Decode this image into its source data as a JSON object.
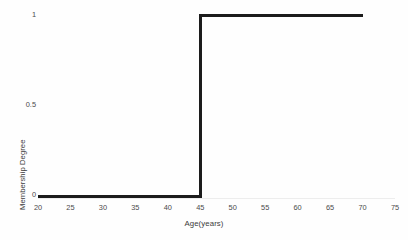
{
  "chart_data": {
    "type": "line",
    "title": "",
    "subtitle": "",
    "xlabel": "Age(years)",
    "ylabel": "Membership Degree",
    "xlim": [
      20,
      75
    ],
    "ylim": [
      0,
      1
    ],
    "grid": false,
    "legend": false,
    "x_ticks": [
      20,
      25,
      30,
      35,
      40,
      45,
      50,
      55,
      60,
      65,
      70,
      75
    ],
    "x_tick_labels": [
      "20",
      "25",
      "30",
      "35",
      "40",
      "45",
      "50",
      "55",
      "60",
      "65",
      "70",
      "75"
    ],
    "y_ticks": [
      0,
      0.5,
      1
    ],
    "y_tick_labels": [
      "0",
      "0.5",
      "1"
    ],
    "series": [
      {
        "name": "membership",
        "style": "step",
        "color": "#1c1c1c",
        "line_width": 3,
        "x": [
          20,
          45,
          45,
          70
        ],
        "y": [
          0,
          0,
          1,
          1
        ],
        "points": [
          {
            "x": 20,
            "y": 0
          },
          {
            "x": 45,
            "y": 0
          },
          {
            "x": 45,
            "y": 1
          },
          {
            "x": 70,
            "y": 1
          }
        ]
      }
    ],
    "annotations": []
  },
  "axes": {
    "x_title": "Age(years)",
    "y_title": "Membership Degree",
    "y_labels": {
      "top": "1",
      "middle": "0.5",
      "bottom": "0"
    }
  },
  "colors": {
    "series": "#1c1c1c",
    "axis_line": "#ededed",
    "tick_text": "#4a4a4a",
    "title_text": "#3c3c3c",
    "background": "#fefefe"
  }
}
